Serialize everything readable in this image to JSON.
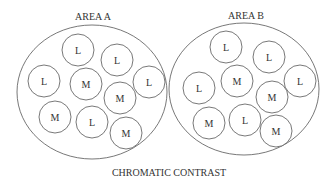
{
  "title": "CHROMATIC CONTRAST",
  "areas": [
    {
      "label": "AREA A",
      "label_pos": [
        93,
        16
      ],
      "ellipse": {
        "cx": 92,
        "cy": 92,
        "rx": 75,
        "ry": 67
      },
      "circles": [
        {
          "text": "L",
          "cx": 78,
          "cy": 50
        },
        {
          "text": "L",
          "cx": 117,
          "cy": 60
        },
        {
          "text": "L",
          "cx": 44,
          "cy": 81
        },
        {
          "text": "M",
          "cx": 86,
          "cy": 84
        },
        {
          "text": "L",
          "cx": 149,
          "cy": 82
        },
        {
          "text": "M",
          "cx": 120,
          "cy": 98
        },
        {
          "text": "M",
          "cx": 55,
          "cy": 117
        },
        {
          "text": "L",
          "cx": 92,
          "cy": 122
        },
        {
          "text": "M",
          "cx": 126,
          "cy": 133
        }
      ]
    },
    {
      "label": "AREA B",
      "label_pos": [
        246,
        15
      ],
      "ellipse": {
        "cx": 244,
        "cy": 89,
        "rx": 75,
        "ry": 66
      },
      "circles": [
        {
          "text": "L",
          "cx": 226,
          "cy": 47
        },
        {
          "text": "L",
          "cx": 269,
          "cy": 57
        },
        {
          "text": "L",
          "cx": 199,
          "cy": 88
        },
        {
          "text": "M",
          "cx": 237,
          "cy": 81
        },
        {
          "text": "L",
          "cx": 300,
          "cy": 81
        },
        {
          "text": "M",
          "cx": 272,
          "cy": 97
        },
        {
          "text": "M",
          "cx": 209,
          "cy": 123
        },
        {
          "text": "L",
          "cx": 245,
          "cy": 120
        },
        {
          "text": "M",
          "cx": 276,
          "cy": 131
        }
      ]
    }
  ],
  "circle_radius": 16,
  "stroke_color": "#555555",
  "text_color": "#333333"
}
